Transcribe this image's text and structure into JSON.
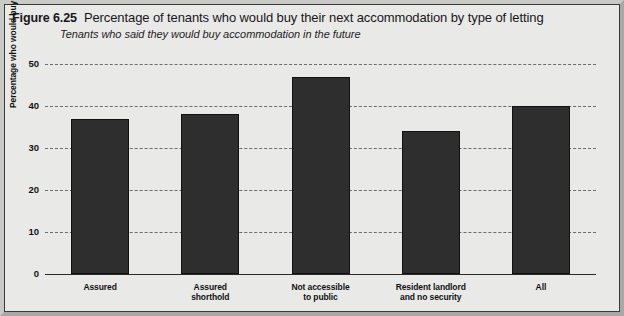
{
  "figure": {
    "number": "Figure 6.25",
    "title": "Percentage of tenants who would buy their next accommodation by type of letting",
    "subtitle": "Tenants who said they would buy accommodation in the future"
  },
  "chart_data": {
    "type": "bar",
    "title": "Percentage of tenants who would buy their next accommodation by type of letting",
    "subtitle": "Tenants who said they would buy accommodation in the future",
    "categories": [
      "Assured",
      "Assured shorthold",
      "Not accessible to public",
      "Resident landlord and no security",
      "All"
    ],
    "category_lines": [
      [
        "Assured"
      ],
      [
        "Assured",
        "shorthold"
      ],
      [
        "Not accessible",
        "to public"
      ],
      [
        "Resident landlord",
        "and no security"
      ],
      [
        "All"
      ]
    ],
    "values": [
      37,
      38,
      47,
      34,
      40
    ],
    "xlabel": "",
    "ylabel": "Percentage who would buy next",
    "ylim": [
      0,
      50
    ],
    "yticks": [
      0,
      10,
      20,
      30,
      40,
      50
    ],
    "grid": true,
    "grid_style": "dashed-horizontal",
    "legend": "none",
    "bar_color": "#2e2e2e",
    "background_color": "#e9e9e7"
  }
}
